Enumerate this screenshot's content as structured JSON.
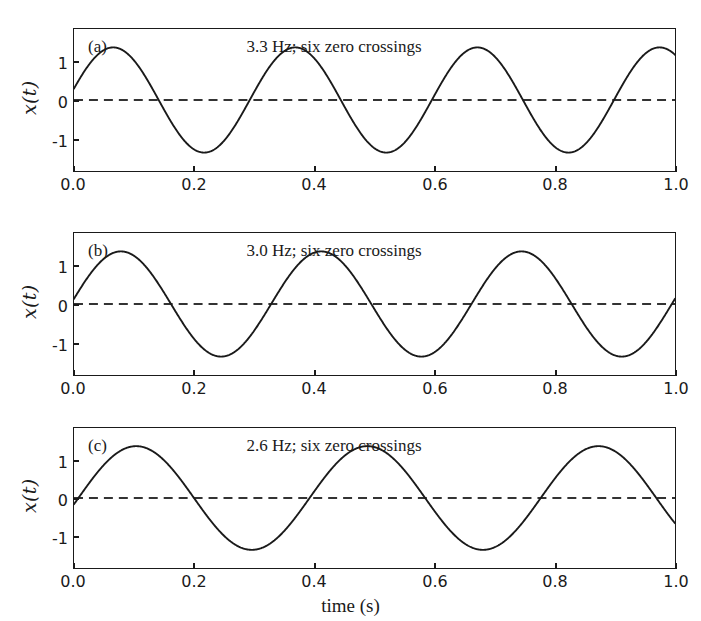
{
  "figure": {
    "background": "#ffffff",
    "line_color": "#1a1a1a",
    "zero_line_color": "#333333",
    "xlabel": "time (s)"
  },
  "axis": {
    "xticks": [
      "0.0",
      "0.2",
      "0.4",
      "0.6",
      "0.8",
      "1.0"
    ],
    "yticks": [
      "1",
      "0",
      "-1"
    ],
    "ylabel": "x(t)"
  },
  "panels": [
    {
      "letter": "(a)",
      "annotation": "3.3 Hz; six zero crossings",
      "frequency_hz": 3.3,
      "phase_rad": 0.22
    },
    {
      "letter": "(b)",
      "annotation": "3.0 Hz; six zero crossings",
      "frequency_hz": 3.0,
      "phase_rad": 0.1
    },
    {
      "letter": "(c)",
      "annotation": "2.6 Hz; six zero crossings",
      "frequency_hz": 2.6,
      "phase_rad": -0.12
    }
  ],
  "chart_data": {
    "type": "line",
    "title": "",
    "xlabel": "time (s)",
    "ylabel": "x(t)",
    "xlim": [
      0.0,
      1.0
    ],
    "ylim": [
      -1.35,
      1.35
    ],
    "xticks": [
      0.0,
      0.2,
      0.4,
      0.6,
      0.8,
      1.0
    ],
    "yticks": [
      -1,
      0,
      1
    ],
    "grid": false,
    "legend": "none",
    "subplots": [
      {
        "panel": "(a)",
        "annotation": "3.3 Hz; six zero crossings",
        "series": [
          {
            "name": "x(t) = sin(2*pi*3.3*t + 0.22)",
            "amplitude": 1.0,
            "frequency_hz": 3.3,
            "phase_rad": 0.22,
            "x": [
              0.0,
              0.05,
              0.1,
              0.15,
              0.2,
              0.25,
              0.3,
              0.35,
              0.4,
              0.45,
              0.5,
              0.55,
              0.6,
              0.65,
              0.7,
              0.75,
              0.8,
              0.85,
              0.9,
              0.95,
              1.0
            ],
            "y": [
              0.218,
              0.921,
              0.866,
              0.106,
              -0.738,
              -0.994,
              -0.438,
              0.521,
              0.993,
              0.697,
              -0.219,
              -0.921,
              -0.866,
              -0.105,
              0.739,
              0.994,
              0.437,
              -0.522,
              -0.993,
              -0.696,
              0.22
            ]
          }
        ],
        "zero_crossings_visible": 6,
        "peaks_t": [
          0.065,
          0.368,
          0.671,
          0.974
        ],
        "troughs_t": [
          0.217,
          0.52,
          0.823
        ]
      },
      {
        "panel": "(b)",
        "annotation": "3.0 Hz; six zero crossings",
        "series": [
          {
            "name": "x(t) = sin(2*pi*3.0*t + 0.1)",
            "amplitude": 1.0,
            "frequency_hz": 3.0,
            "phase_rad": 0.1,
            "x": [
              0.0,
              0.05,
              0.1,
              0.15,
              0.2,
              0.25,
              0.3,
              0.35,
              0.4,
              0.45,
              0.5,
              0.55,
              0.6,
              0.65,
              0.7,
              0.75,
              0.8,
              0.85,
              0.9,
              0.95,
              1.0
            ],
            "y": [
              0.1,
              0.906,
              0.89,
              0.194,
              -0.685,
              -0.995,
              -0.565,
              0.382,
              0.982,
              0.794,
              -0.001,
              -0.858,
              -0.938,
              -0.288,
              0.616,
              1.0,
              0.64,
              -0.266,
              -0.93,
              -0.87,
              0.1
            ]
          }
        ],
        "zero_crossings_visible": 6,
        "peaks_t": [
          0.075,
          0.408,
          0.742
        ],
        "troughs_t": [
          0.242,
          0.575,
          0.908
        ]
      },
      {
        "panel": "(c)",
        "annotation": "2.6 Hz; six zero crossings",
        "series": [
          {
            "name": "x(t) = sin(2*pi*2.6*t - 0.12)",
            "amplitude": 1.0,
            "frequency_hz": 2.6,
            "phase_rad": -0.12,
            "x": [
              0.0,
              0.05,
              0.1,
              0.15,
              0.2,
              0.25,
              0.3,
              0.35,
              0.4,
              0.45,
              0.5,
              0.55,
              0.6,
              0.65,
              0.7,
              0.75,
              0.8,
              0.85,
              0.9,
              0.95,
              1.0
            ],
            "y": [
              -0.12,
              0.665,
              0.995,
              0.707,
              -0.047,
              -0.722,
              -0.99,
              -0.654,
              0.12,
              0.765,
              0.982,
              0.597,
              -0.192,
              -0.803,
              -0.97,
              -0.537,
              0.263,
              0.838,
              0.952,
              0.474,
              -0.332
            ]
          }
        ],
        "zero_crossings_visible": 6,
        "peaks_t": [
          0.103,
          0.488,
          0.872
        ],
        "troughs_t": [
          0.295,
          0.68
        ]
      }
    ]
  }
}
